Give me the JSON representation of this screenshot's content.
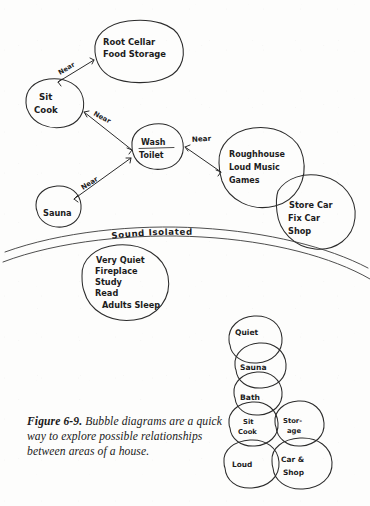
{
  "figure": {
    "number": "Figure 6-9.",
    "caption": "Bubble diagrams are a quick way to explore possible relationships between areas of a house.",
    "caption_line1": "Bubble diagrams are a",
    "caption_line2": "quick way to explore possible",
    "caption_line3": "relationships between areas of a house.",
    "ink_color": "#2b2b2b",
    "paper_color": "#fdfdfc"
  },
  "main_diagram": {
    "bubbles": [
      {
        "id": "root-cellar",
        "lines": [
          "Root Cellar",
          "Food Storage"
        ],
        "line1": "Root Cellar",
        "line2": "Food Storage"
      },
      {
        "id": "sit-cook",
        "lines": [
          "Sit",
          "Cook"
        ],
        "line1": "Sit",
        "line2": "Cook"
      },
      {
        "id": "wash-toilet",
        "lines": [
          "Wash",
          "Toilet"
        ],
        "line1": "Wash",
        "line2": "Toilet"
      },
      {
        "id": "roughhouse",
        "lines": [
          "Roughhouse",
          "Loud Music",
          "Games"
        ],
        "line1": "Roughhouse",
        "line2": "Loud Music",
        "line3": "Games"
      },
      {
        "id": "store-car",
        "lines": [
          "Store Car",
          "Fix Car",
          "Shop"
        ],
        "line1": "Store Car",
        "line2": "Fix Car",
        "line3": "Shop"
      },
      {
        "id": "sauna",
        "lines": [
          "Sauna"
        ],
        "line1": "Sauna"
      },
      {
        "id": "very-quiet",
        "lines": [
          "Very Quiet",
          "Fireplace",
          "Study",
          "Read",
          "Adults Sleep"
        ],
        "line1": "Very Quiet",
        "line2": "Fireplace",
        "line3": "Study",
        "line4": "Read",
        "line5": "Adults Sleep"
      }
    ],
    "relations": [
      {
        "id": "rel-cellar-sitcook",
        "label": "Near",
        "from": "sit-cook",
        "to": "root-cellar"
      },
      {
        "id": "rel-sitcook-wash",
        "label": "Near",
        "from": "sit-cook",
        "to": "wash-toilet"
      },
      {
        "id": "rel-wash-roughhouse",
        "label": "Near",
        "from": "wash-toilet",
        "to": "roughhouse"
      },
      {
        "id": "rel-sauna-wash",
        "label": "Near",
        "from": "sauna",
        "to": "wash-toilet"
      }
    ],
    "zone_label": "Sound Isolated"
  },
  "stack_diagram": {
    "bubbles": [
      {
        "id": "stack-quiet",
        "line1": "Quiet"
      },
      {
        "id": "stack-sauna",
        "line1": "Sauna"
      },
      {
        "id": "stack-bath",
        "line1": "Bath"
      },
      {
        "id": "stack-sit-cook",
        "line1": "Sit",
        "line2": "Cook"
      },
      {
        "id": "stack-storage",
        "line1": "Stor-",
        "line2": "age"
      },
      {
        "id": "stack-loud",
        "line1": "Loud"
      },
      {
        "id": "stack-car-shop",
        "line1": "Car &",
        "line2": "Shop"
      }
    ]
  }
}
